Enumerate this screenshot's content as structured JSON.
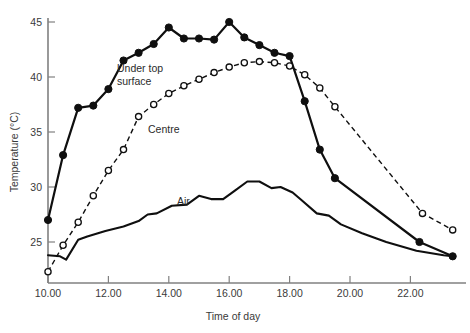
{
  "chart_data": {
    "type": "line",
    "title": "",
    "xlabel": "Time of day",
    "ylabel": "Temperature (°C)",
    "xlim": [
      10,
      23
    ],
    "ylim": [
      22,
      45.6
    ],
    "grid": false,
    "legend_position": "inline-annotations",
    "x_ticks": [
      {
        "value": 10,
        "label": "10.00"
      },
      {
        "value": 12,
        "label": "12.00"
      },
      {
        "value": 14,
        "label": "14.00"
      },
      {
        "value": 16,
        "label": "16.00"
      },
      {
        "value": 18,
        "label": "18.00"
      },
      {
        "value": 20,
        "label": "20.00"
      },
      {
        "value": 22,
        "label": "22.00"
      }
    ],
    "y_ticks": [
      {
        "value": 25,
        "label": "25"
      },
      {
        "value": 30,
        "label": "30"
      },
      {
        "value": 35,
        "label": "35"
      },
      {
        "value": 40,
        "label": "40"
      },
      {
        "value": 45,
        "label": "45"
      }
    ],
    "series": [
      {
        "name": "Under top surface",
        "marker": "filled-circle",
        "linestyle": "solid",
        "color": "#0f0f0f",
        "label_text": "Under top\nsurface",
        "label_line_1": "Under top",
        "label_line_2": "surface",
        "x": [
          10.0,
          10.5,
          11.0,
          11.5,
          12.0,
          12.5,
          13.0,
          13.5,
          14.0,
          14.5,
          15.0,
          15.5,
          16.0,
          16.5,
          17.0,
          17.5,
          18.0,
          18.5,
          19.0,
          19.5,
          22.3,
          23.4
        ],
        "y": [
          27.0,
          32.9,
          37.2,
          37.4,
          38.9,
          41.5,
          42.2,
          43.0,
          44.5,
          43.5,
          43.5,
          43.4,
          45.0,
          43.6,
          42.9,
          42.2,
          41.9,
          37.8,
          33.4,
          30.8,
          25.0,
          23.7
        ]
      },
      {
        "name": "Centre",
        "marker": "open-circle",
        "linestyle": "dashed",
        "color": "#0f0f0f",
        "label_text": "Centre",
        "x": [
          10.0,
          10.5,
          11.0,
          11.5,
          12.0,
          12.5,
          13.0,
          13.5,
          14.0,
          14.5,
          15.0,
          15.5,
          16.0,
          16.5,
          17.0,
          17.5,
          18.0,
          18.5,
          19.0,
          19.5,
          22.4,
          23.4
        ],
        "y": [
          22.3,
          24.7,
          26.8,
          29.2,
          31.5,
          33.4,
          36.4,
          37.5,
          38.5,
          39.2,
          39.8,
          40.4,
          40.9,
          41.3,
          41.4,
          41.3,
          41.0,
          40.2,
          39.0,
          37.3,
          27.6,
          26.1
        ]
      },
      {
        "name": "Air",
        "marker": "none",
        "linestyle": "solid",
        "color": "#0f0f0f",
        "label_text": "Air",
        "x": [
          10.0,
          10.4,
          10.6,
          11.0,
          11.3,
          11.9,
          12.5,
          13.0,
          13.3,
          13.6,
          14.1,
          14.6,
          15.0,
          15.4,
          15.8,
          16.2,
          16.6,
          17.0,
          17.4,
          17.7,
          18.1,
          18.4,
          18.9,
          19.3,
          19.7,
          20.4,
          21.2,
          22.2,
          23.1,
          23.4
        ],
        "y": [
          23.8,
          23.7,
          23.4,
          25.2,
          25.5,
          26.0,
          26.4,
          26.9,
          27.5,
          27.6,
          28.3,
          28.4,
          29.2,
          28.9,
          28.9,
          29.7,
          30.5,
          30.5,
          29.9,
          30.0,
          29.5,
          28.8,
          27.6,
          27.4,
          26.6,
          25.8,
          25.0,
          24.2,
          23.8,
          23.7
        ]
      }
    ]
  },
  "axes": {
    "y_title": "Temperature (°C)",
    "x_title": "Time of day"
  }
}
